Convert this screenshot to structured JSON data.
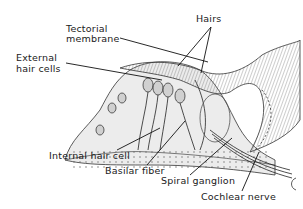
{
  "diagram": {
    "labels": {
      "tectorial_line1": "Tectorial",
      "tectorial_line2": "membrane",
      "hairs": "Hairs",
      "external_line1": "External",
      "external_line2": "hair cells",
      "internal_hair_cell": "Internal hair cell",
      "basilar_fiber": "Basilar fiber",
      "spiral_ganglion": "Spiral ganglion",
      "cochlear_nerve": "Cochlear nerve"
    },
    "colors": {
      "ink": "#1a1a1a",
      "background": "#ffffff",
      "shade": "#bdbdbd"
    }
  }
}
